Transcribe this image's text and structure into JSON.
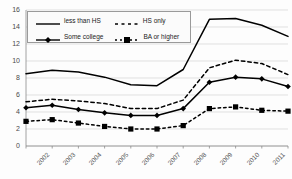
{
  "chart_data": {
    "type": "line",
    "title": "",
    "xlabel": "",
    "ylabel": "",
    "x": [
      "2002",
      "2003",
      "2004",
      "2005",
      "2006",
      "2007",
      "2008",
      "2009",
      "2010",
      "2011",
      "2012"
    ],
    "categories": [
      "2002",
      "2003",
      "2004",
      "2005",
      "2006",
      "2007",
      "2008",
      "2009",
      "2010",
      "2011",
      "2012"
    ],
    "ylim": [
      0,
      16
    ],
    "yticks": [
      0,
      2,
      4,
      6,
      8,
      10,
      12,
      14,
      16
    ],
    "grid": true,
    "legend_position": "top-left",
    "series": [
      {
        "name": "less than HS",
        "style": "solid",
        "marker": "none",
        "color": "#000000",
        "values": [
          8.5,
          8.9,
          8.7,
          8.1,
          7.2,
          7.1,
          9.0,
          14.9,
          15.0,
          14.2,
          12.9
        ]
      },
      {
        "name": "HS only",
        "style": "dashed",
        "marker": "none",
        "color": "#000000",
        "values": [
          5.2,
          5.5,
          5.3,
          5.0,
          4.4,
          4.4,
          5.4,
          9.2,
          10.1,
          9.7,
          8.4
        ]
      },
      {
        "name": "Some college",
        "style": "solid",
        "marker": "diamond",
        "color": "#000000",
        "values": [
          4.5,
          4.8,
          4.3,
          3.9,
          3.6,
          3.6,
          4.4,
          7.5,
          8.1,
          7.9,
          7.0
        ]
      },
      {
        "name": "BA or higher",
        "style": "dash-dot",
        "marker": "square",
        "color": "#000000",
        "values": [
          2.9,
          3.1,
          2.7,
          2.3,
          2.0,
          2.0,
          2.4,
          4.4,
          4.6,
          4.2,
          4.1
        ]
      }
    ]
  },
  "legend": {
    "items": [
      {
        "label": "less than HS"
      },
      {
        "label": "HS only"
      },
      {
        "label": "Some college"
      },
      {
        "label": "BA or higher"
      }
    ]
  }
}
